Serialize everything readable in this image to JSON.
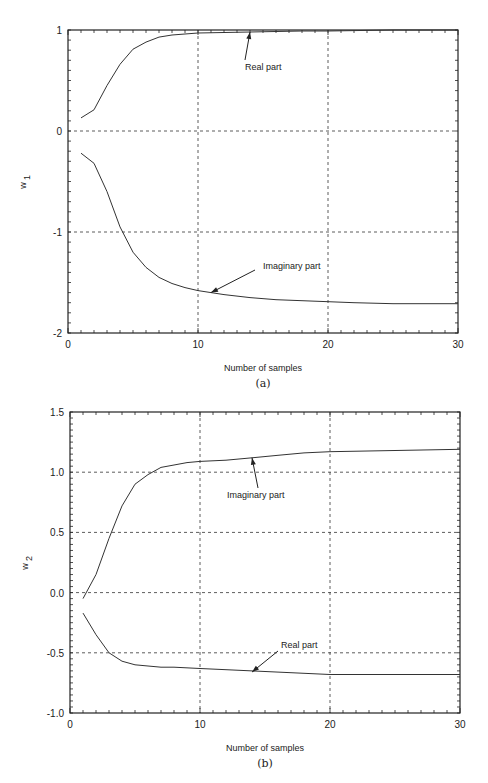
{
  "chart_data": [
    {
      "type": "line",
      "panel_label": "(a)",
      "title": "",
      "xlabel": "Number of samples",
      "ylabel": "w1",
      "ylabel_main": "w",
      "ylabel_sub": "1",
      "xlim": [
        0,
        30
      ],
      "ylim": [
        -2,
        1
      ],
      "xticks": [
        0,
        10,
        20,
        30
      ],
      "xtick_labels": [
        "0",
        "10",
        "20",
        "30"
      ],
      "yticks": [
        1,
        0,
        -1,
        -2
      ],
      "ytick_labels": [
        "1",
        "0",
        "-1",
        "-2"
      ],
      "grid": "dashed at major ticks",
      "legend": "none (inline annotations)",
      "series": [
        {
          "name": "Real part",
          "x": [
            1,
            2,
            3,
            4,
            5,
            6,
            7,
            8,
            9,
            10,
            12,
            14,
            16,
            18,
            20,
            25,
            30
          ],
          "values": [
            0.13,
            0.21,
            0.45,
            0.66,
            0.81,
            0.88,
            0.93,
            0.95,
            0.96,
            0.97,
            0.975,
            0.98,
            0.985,
            0.99,
            0.99,
            1.0,
            1.0
          ]
        },
        {
          "name": "Imaginary part",
          "x": [
            1,
            2,
            3,
            4,
            5,
            6,
            7,
            8,
            9,
            10,
            12,
            14,
            16,
            18,
            20,
            22,
            25,
            28,
            30
          ],
          "values": [
            -0.22,
            -0.32,
            -0.6,
            -0.95,
            -1.2,
            -1.35,
            -1.45,
            -1.51,
            -1.55,
            -1.58,
            -1.62,
            -1.65,
            -1.67,
            -1.68,
            -1.69,
            -1.7,
            -1.71,
            -1.71,
            -1.71
          ]
        }
      ],
      "annotations": [
        {
          "text": "Real part",
          "arrow_to_x": 14,
          "arrow_to_y": 0.98
        },
        {
          "text": "Imaginary part",
          "arrow_to_x": 11,
          "arrow_to_y": -1.6
        }
      ]
    },
    {
      "type": "line",
      "panel_label": "(b)",
      "title": "",
      "xlabel": "Number of samples",
      "ylabel": "w2",
      "ylabel_main": "w",
      "ylabel_sub": "2",
      "xlim": [
        0,
        30
      ],
      "ylim": [
        -1.0,
        1.5
      ],
      "xticks": [
        0,
        10,
        20,
        30
      ],
      "xtick_labels": [
        "0",
        "10",
        "20",
        "30"
      ],
      "yticks": [
        1.5,
        1.0,
        0.5,
        0.0,
        -0.5,
        -1.0
      ],
      "ytick_labels": [
        "1.5",
        "1.0",
        "0.5",
        "0.0",
        "-0.5",
        "-1.0"
      ],
      "grid": "dashed at major ticks",
      "legend": "none (inline annotations)",
      "series": [
        {
          "name": "Imaginary part",
          "x": [
            1,
            2,
            3,
            4,
            5,
            6,
            7,
            8,
            9,
            10,
            12,
            14,
            16,
            18,
            20,
            25,
            30
          ],
          "values": [
            -0.05,
            0.15,
            0.45,
            0.72,
            0.9,
            0.98,
            1.04,
            1.06,
            1.08,
            1.09,
            1.1,
            1.12,
            1.14,
            1.16,
            1.17,
            1.18,
            1.19
          ]
        },
        {
          "name": "Real part",
          "x": [
            1,
            2,
            3,
            4,
            5,
            6,
            7,
            8,
            10,
            12,
            14,
            16,
            18,
            20,
            25,
            30
          ],
          "values": [
            -0.17,
            -0.35,
            -0.5,
            -0.57,
            -0.6,
            -0.61,
            -0.62,
            -0.62,
            -0.63,
            -0.64,
            -0.65,
            -0.66,
            -0.67,
            -0.68,
            -0.68,
            -0.68
          ]
        }
      ],
      "annotations": [
        {
          "text": "Imaginary part",
          "arrow_to_x": 14,
          "arrow_to_y": 1.12
        },
        {
          "text": "Real part",
          "arrow_to_x": 14,
          "arrow_to_y": -0.66
        }
      ]
    }
  ],
  "figure": {
    "panels": [
      {
        "caption": "(a)",
        "xlabel": "Number of samples"
      },
      {
        "caption": "(b)",
        "xlabel": "Number of samples"
      }
    ]
  }
}
